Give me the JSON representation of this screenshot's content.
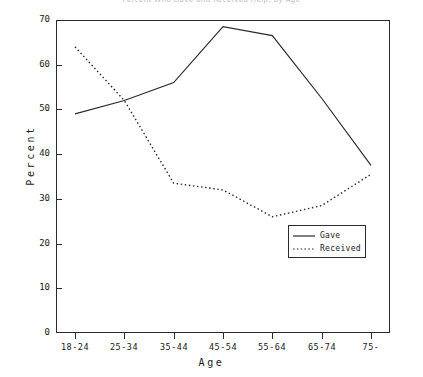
{
  "chart_data": {
    "type": "line",
    "title": "Percent Who Gave and Received Help, by Age",
    "xlabel": "Age",
    "ylabel": "Percent",
    "categories": [
      "18-24",
      "25-34",
      "35-44",
      "45-54",
      "55-64",
      "65-74",
      "75-"
    ],
    "ylim": [
      0,
      70
    ],
    "yticks": [
      0,
      10,
      20,
      30,
      40,
      50,
      60,
      70
    ],
    "grid": false,
    "legend_position": "center-right-inside",
    "series": [
      {
        "name": "Gave",
        "style": "solid",
        "color": "#2b2b2b",
        "values": [
          49,
          52,
          56,
          68.5,
          66.5,
          52.5,
          37.5
        ]
      },
      {
        "name": "Received",
        "style": "dotted",
        "color": "#2b2b2b",
        "values": [
          64,
          52,
          33.5,
          32,
          26,
          28.5,
          35.5
        ]
      }
    ]
  },
  "legend": {
    "entries": [
      {
        "label": "Gave",
        "style": "solid"
      },
      {
        "label": "Received",
        "style": "dotted"
      }
    ]
  }
}
